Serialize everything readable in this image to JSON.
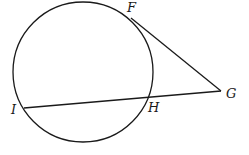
{
  "diagram": {
    "type": "circle-tangent-secant",
    "stroke_color": "#1a1a1a",
    "background": "#ffffff",
    "circle": {
      "cx": 83,
      "cy": 72,
      "r": 70
    },
    "points": {
      "F": {
        "label": "F",
        "x": 131,
        "y": 18,
        "lx": 127,
        "ly": 12
      },
      "G": {
        "label": "G",
        "x": 221,
        "y": 91,
        "lx": 226,
        "ly": 98
      },
      "H": {
        "label": "H",
        "x": 148,
        "y": 97,
        "lx": 148,
        "ly": 112
      },
      "I": {
        "label": "I",
        "x": 24,
        "y": 108,
        "lx": 11,
        "ly": 114
      }
    },
    "segments": [
      {
        "name": "tangent-FG",
        "from": "F",
        "to": "G"
      },
      {
        "name": "secant-IG",
        "from": "I",
        "to": "G"
      }
    ]
  }
}
